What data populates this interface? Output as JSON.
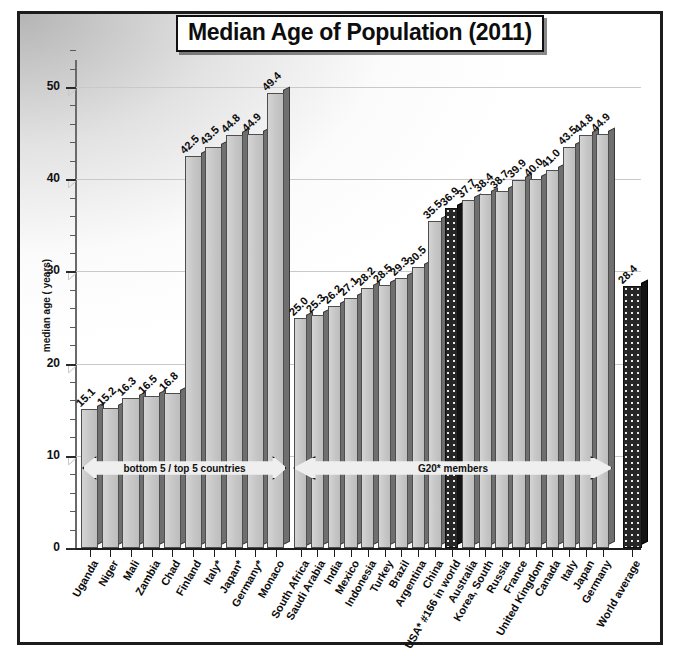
{
  "chart_data": {
    "type": "bar",
    "title": "Median Age of Population (2011)",
    "xlabel": "",
    "ylabel": "median age ( years)",
    "ylim": [
      0,
      55
    ],
    "ytick_labels": [
      "0",
      "10",
      "20",
      "30",
      "40",
      "50"
    ],
    "ytick_values": [
      0,
      10,
      20,
      30,
      40,
      50
    ],
    "grid": true,
    "legend": "none",
    "categories": [
      "Uganda",
      "Niger",
      "Mali",
      "Zambia",
      "Chad",
      "Finland",
      "Italy*",
      "Japan*",
      "Germany*",
      "Monaco",
      "South Africa",
      "Saudi Arabia",
      "India",
      "Mexico",
      "Indonesia",
      "Turkey",
      "Brazil",
      "Argentina",
      "China",
      "USA* #166 in world",
      "Australia",
      "Korea, South",
      "Russia",
      "France",
      "United Kingdom",
      "Canada",
      "Italy",
      "Japan",
      "Germany",
      "World average"
    ],
    "values": [
      15.1,
      15.2,
      16.3,
      16.5,
      16.8,
      42.5,
      43.5,
      44.8,
      44.9,
      49.4,
      25.0,
      25.3,
      26.2,
      27.1,
      28.2,
      28.5,
      29.3,
      30.5,
      35.5,
      36.9,
      37.7,
      38.4,
      38.7,
      39.9,
      40.0,
      41.0,
      43.5,
      44.8,
      44.9,
      28.4
    ],
    "value_labels": [
      "15.1",
      "15.2",
      "16.3",
      "16.5",
      "16.8",
      "42.5",
      "43.5",
      "44.8",
      "44.9",
      "49.4",
      "25.0",
      "25.3",
      "26.2",
      "27.1",
      "28.2",
      "28.5",
      "29.3",
      "30.5",
      "35.5",
      "36.9",
      "37.7",
      "38.4",
      "38.7",
      "39.9",
      "40.0",
      "41.0",
      "43.5",
      "44.8",
      "44.9",
      "28.4"
    ],
    "highlighted_bars": [
      "USA* #166 in world",
      "World average"
    ],
    "annotations": [
      {
        "text": "bottom 5 / top 5 countries",
        "spans": "Uganda–Monaco"
      },
      {
        "text": "G20* members",
        "spans": "South Africa–Germany"
      }
    ],
    "colors": {
      "bar_face": "#c6c6c6",
      "bar_side": "#6f6f6f",
      "bar_highlight": "#262626",
      "grid": "#c9c9c9",
      "axis": "#1d1d1d",
      "text": "#0c0c0c",
      "frame": "#1c1c1c"
    }
  }
}
